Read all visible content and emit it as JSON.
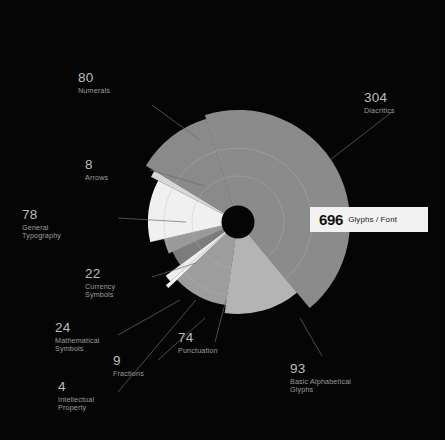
{
  "background": "#050505",
  "callout": {
    "value": "696",
    "unit": "Glyphs / Font",
    "bg": "#f2f2f2",
    "fg": "#121212"
  },
  "chart_data": {
    "type": "pie",
    "title": "",
    "subtitle": "",
    "xlabel": "",
    "ylabel": "",
    "total": 696,
    "total_label": "696 Glyphs / Font",
    "grid": true,
    "legend_position": "around-chart",
    "center": {
      "x": 238,
      "y": 222
    },
    "inner_hole_radius": 16,
    "max_radius": 112,
    "radius_scale": "sqrt-of-value",
    "start_angle_deg": -17,
    "direction": "clockwise",
    "categories": [
      "Diacritics",
      "Basic Alphabetical Glyphs",
      "Punctuation",
      "Intellectual Property",
      "Fractions",
      "Mathematical Symbols",
      "Currency Symbols",
      "General Typography",
      "Arrows",
      "Numerals"
    ],
    "values": [
      304,
      93,
      74,
      4,
      9,
      24,
      22,
      78,
      8,
      80
    ],
    "slices": [
      {
        "label": "Diacritics",
        "value": 304,
        "color": "#8b8b8b",
        "sweep_deg": 157.2,
        "radius": 112,
        "label_pos": "top-right"
      },
      {
        "label": "Basic Alphabetical Glyphs",
        "value": 93,
        "color": "#b4b4b4",
        "sweep_deg": 48.1,
        "radius": 92,
        "label_pos": "bottom-right"
      },
      {
        "label": "Punctuation",
        "value": 74,
        "color": "#9d9d9d",
        "sweep_deg": 38.3,
        "radius": 84,
        "label_pos": "bottom"
      },
      {
        "label": "Intellectual Property",
        "value": 4,
        "color": "#f4f4f4",
        "sweep_deg": 2.1,
        "radius": 96,
        "label_pos": "bottom-left"
      },
      {
        "label": "Fractions",
        "value": 9,
        "color": "#ededed",
        "sweep_deg": 4.7,
        "radius": 90,
        "label_pos": "bottom-left"
      },
      {
        "label": "Mathematical Symbols",
        "value": 24,
        "color": "#7c7c7c",
        "sweep_deg": 12.4,
        "radius": 72,
        "label_pos": "left-lower"
      },
      {
        "label": "Currency Symbols",
        "value": 22,
        "color": "#9a9a9a",
        "sweep_deg": 11.4,
        "radius": 76,
        "label_pos": "left-lower"
      },
      {
        "label": "General Typography",
        "value": 78,
        "color": "#f0f0f0",
        "sweep_deg": 40.3,
        "radius": 90,
        "label_pos": "left"
      },
      {
        "label": "Arrows",
        "value": 8,
        "color": "#d8d8d8",
        "sweep_deg": 4.1,
        "radius": 98,
        "label_pos": "left-upper"
      },
      {
        "label": "Numerals",
        "value": 80,
        "color": "#8a8a8a",
        "sweep_deg": 41.4,
        "radius": 108,
        "label_pos": "top-left"
      }
    ],
    "gridline_radii": [
      46,
      74
    ],
    "gridline_color": "#b9b9b9"
  },
  "labels": [
    {
      "name": "numerals",
      "num": "80",
      "cap": "Numerals"
    },
    {
      "name": "diacritics",
      "num": "304",
      "cap": "Diacritics"
    },
    {
      "name": "arrows",
      "num": "8",
      "cap": "Arrows"
    },
    {
      "name": "general-typography",
      "num": "78",
      "cap": "General\nTypography"
    },
    {
      "name": "currency-symbols",
      "num": "22",
      "cap": "Currency\nSymbols"
    },
    {
      "name": "mathematical-symbols",
      "num": "24",
      "cap": "Mathematical\nSymbols"
    },
    {
      "name": "fractions",
      "num": "9",
      "cap": "Fractions"
    },
    {
      "name": "intellectual-property",
      "num": "4",
      "cap": "Intellectual\nProperty"
    },
    {
      "name": "punctuation",
      "num": "74",
      "cap": "Punctuation"
    },
    {
      "name": "basic-alphabetical",
      "num": "93",
      "cap": "Basic Alphabetical\nGlyphs"
    }
  ]
}
